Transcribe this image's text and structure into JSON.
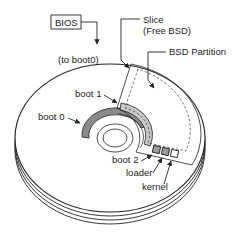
{
  "diagram": {
    "labels": {
      "bios": "BIOS",
      "to_boot0": "(to boot0)",
      "slice_line1": "Slice",
      "slice_line2": "(Free BSD)",
      "bsd_partition": "BSD Partition",
      "boot0": "boot 0",
      "boot1": "boot 1",
      "boot2": "boot 2",
      "loader": "loader",
      "kernel": "kernel"
    },
    "colors": {
      "stroke": "#222222",
      "boot0_fill": "#8a8a8a",
      "boot1_fill": "#c8c8c8",
      "boot2_fill": "#9a9a9a",
      "loader_fill": "#9a9a9a",
      "kernel_fill": "#ffffff",
      "background": "#ffffff"
    }
  }
}
